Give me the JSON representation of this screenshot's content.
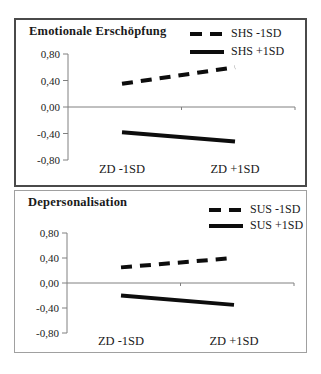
{
  "window": {
    "background": "#ffffff"
  },
  "colors": {
    "line": "#0d0d0d",
    "axis": "#808080",
    "text": "#1a1a1a",
    "top_panel_border": "#4a4a4a",
    "bottom_panel_border": "#a0a0a0"
  },
  "chart_data": [
    {
      "type": "line",
      "title": "Emotionale Erschöpfung",
      "categories": [
        "ZD -1SD",
        "ZD +1SD"
      ],
      "series": [
        {
          "name": "SHS -1SD",
          "values": [
            0.35,
            0.6
          ],
          "line_style": "dashed",
          "color": "#0d0d0d"
        },
        {
          "name": "SHS +1SD",
          "values": [
            -0.38,
            -0.52
          ],
          "line_style": "solid",
          "color": "#0d0d0d"
        }
      ],
      "ylim": [
        -0.8,
        0.8
      ],
      "yticks": [
        0.8,
        0.4,
        0.0,
        -0.4,
        -0.8
      ],
      "ytick_labels": [
        "0,80",
        "0,40",
        "0,00",
        "-0,40",
        "-0,80"
      ],
      "xlabel": "",
      "ylabel": "",
      "grid": false,
      "legend_position": "top-right"
    },
    {
      "type": "line",
      "title": "Depersonalisation",
      "categories": [
        "ZD -1SD",
        "ZD +1SD"
      ],
      "series": [
        {
          "name": "SUS -1SD",
          "values": [
            0.25,
            0.4
          ],
          "line_style": "dashed",
          "color": "#0d0d0d"
        },
        {
          "name": "SUS +1SD",
          "values": [
            -0.2,
            -0.35
          ],
          "line_style": "solid",
          "color": "#0d0d0d"
        }
      ],
      "ylim": [
        -0.8,
        0.8
      ],
      "yticks": [
        0.8,
        0.4,
        0.0,
        -0.4,
        -0.8
      ],
      "ytick_labels": [
        "0,80",
        "0,40",
        "0,00",
        "-0,40",
        "-0,80"
      ],
      "xlabel": "",
      "ylabel": "",
      "grid": false,
      "legend_position": "top-right"
    }
  ]
}
